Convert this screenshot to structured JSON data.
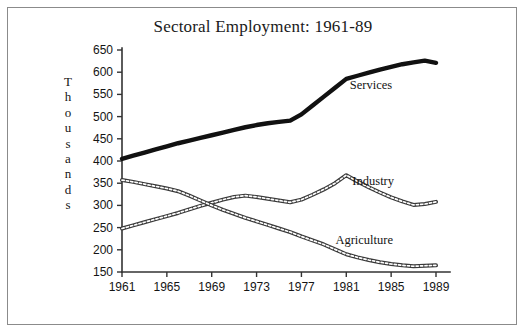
{
  "figure": {
    "title": "Sectoral Employment: 1961-89",
    "y_axis_caption_letters": [
      "T",
      "h",
      "o",
      "u",
      "s",
      "a",
      "n",
      "d",
      "s"
    ],
    "y_axis_caption": "Thousands",
    "border_color": "#8b8b8b",
    "axis_color": "#333333",
    "background": "#ffffff"
  },
  "chart_data": {
    "type": "line",
    "title": "Sectoral Employment: 1961-89",
    "xlabel": "",
    "ylabel": "Thousands",
    "xlim": [
      1961,
      1989
    ],
    "ylim": [
      150,
      650
    ],
    "ytick_step": 50,
    "xtick_step": 4,
    "grid": false,
    "legend": "inline-labels",
    "yticks": [
      150,
      200,
      250,
      300,
      350,
      400,
      450,
      500,
      550,
      600,
      650
    ],
    "xticks": [
      1961,
      1965,
      1969,
      1973,
      1977,
      1981,
      1985,
      1989
    ],
    "xtick_labels": [
      "1961",
      "1965",
      "1969",
      "1973",
      "1977",
      "1981",
      "1985",
      "1989"
    ],
    "ytick_labels": [
      "150",
      "200",
      "250",
      "300",
      "350",
      "400",
      "450",
      "500",
      "550",
      "600",
      "650"
    ],
    "x": [
      1961,
      1962,
      1963,
      1964,
      1965,
      1966,
      1967,
      1968,
      1969,
      1970,
      1971,
      1972,
      1973,
      1974,
      1975,
      1976,
      1977,
      1978,
      1979,
      1980,
      1981,
      1982,
      1983,
      1984,
      1985,
      1986,
      1987,
      1988,
      1989
    ],
    "series": [
      {
        "name": "Services",
        "style": "solid-thick-black",
        "color": "#111111",
        "label_x": 1983.2,
        "label_y": 563,
        "values": [
          405,
          412,
          419,
          426,
          433,
          440,
          446,
          452,
          458,
          464,
          470,
          476,
          481,
          485,
          488,
          491,
          505,
          525,
          545,
          565,
          585,
          592,
          599,
          606,
          612,
          618,
          622,
          626,
          621
        ]
      },
      {
        "name": "Industry",
        "style": "hatched-outline",
        "color": "#3a3a3a",
        "label_x": 1983.4,
        "label_y": 345,
        "values": [
          248,
          255,
          262,
          269,
          276,
          283,
          291,
          299,
          306,
          313,
          319,
          322,
          319,
          315,
          311,
          307,
          313,
          324,
          336,
          350,
          368,
          354,
          341,
          329,
          318,
          309,
          301,
          303,
          308
        ]
      },
      {
        "name": "Agriculture",
        "style": "hatched-outline",
        "color": "#3a3a3a",
        "label_x": 1982.6,
        "label_y": 213,
        "values": [
          357,
          353,
          348,
          343,
          338,
          332,
          322,
          311,
          300,
          290,
          281,
          272,
          264,
          256,
          248,
          240,
          230,
          221,
          212,
          201,
          190,
          183,
          177,
          172,
          168,
          165,
          163,
          164,
          165
        ]
      }
    ]
  }
}
